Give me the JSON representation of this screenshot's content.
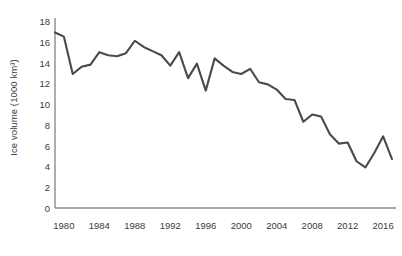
{
  "chart_data": {
    "type": "line",
    "title": "",
    "subtitle": "",
    "xlabel": "",
    "ylabel": "Ice volume (1000 km³)",
    "grid": false,
    "legend": null,
    "legend_position": "none",
    "line_color": "#4a4a4a",
    "axis_color": "#8c8c8c",
    "text_color": "#3b3b3b",
    "xlim": [
      1979,
      2017
    ],
    "ylim": [
      0,
      18
    ],
    "ytick_labels": [
      "0",
      "2",
      "4",
      "6",
      "8",
      "10",
      "12",
      "14",
      "16",
      "18"
    ],
    "ytick_values": [
      0,
      2,
      4,
      6,
      8,
      10,
      12,
      14,
      16,
      18
    ],
    "xtick_labels": [
      "1980",
      "1984",
      "1988",
      "1992",
      "1996",
      "2000",
      "2004",
      "2008",
      "2012",
      "2016"
    ],
    "xtick_values": [
      1980,
      1984,
      1988,
      1992,
      1996,
      2000,
      2004,
      2008,
      2012,
      2016
    ],
    "x": [
      1979,
      1980,
      1981,
      1982,
      1983,
      1984,
      1985,
      1986,
      1987,
      1988,
      1989,
      1990,
      1991,
      1992,
      1993,
      1994,
      1995,
      1996,
      1997,
      1998,
      1999,
      2000,
      2001,
      2002,
      2003,
      2004,
      2005,
      2006,
      2007,
      2008,
      2009,
      2010,
      2011,
      2012,
      2013,
      2014,
      2015,
      2016,
      2017
    ],
    "series": [
      {
        "name": "Ice volume",
        "values": [
          16.9,
          16.5,
          12.9,
          13.6,
          13.8,
          15.0,
          14.7,
          14.6,
          14.9,
          16.1,
          15.5,
          15.1,
          14.7,
          13.7,
          15.0,
          12.5,
          13.9,
          11.3,
          14.4,
          13.7,
          13.1,
          12.9,
          13.4,
          12.1,
          11.9,
          11.4,
          10.5,
          10.4,
          8.3,
          9.0,
          8.8,
          7.1,
          6.2,
          6.3,
          4.5,
          3.9,
          5.3,
          6.9,
          4.7
        ]
      }
    ]
  }
}
